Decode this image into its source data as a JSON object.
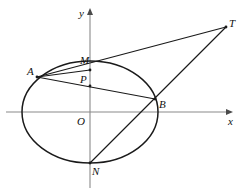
{
  "figure": {
    "kind": "geometry-diagram",
    "width": 245,
    "height": 195,
    "background_color": "#ffffff",
    "curve_color": "#1a1a1a",
    "axis_color": "#8a8a8a",
    "label_color": "#111111"
  },
  "axes": {
    "x_label": "x",
    "y_label": "y",
    "origin_label": "O",
    "x_axis": {
      "y_px": 112,
      "x_start_px": 6,
      "x_end_px": 233
    },
    "y_axis": {
      "x_px": 90,
      "y_start_px": 8,
      "y_end_px": 188
    },
    "arrows": [
      "x-positive",
      "y-positive"
    ]
  },
  "ellipse": {
    "center_px": {
      "x": 90,
      "y": 112
    },
    "semi_axis_x_px": 68,
    "semi_axis_y_px": 51,
    "stroke_width": 1.5
  },
  "points": {
    "A": {
      "label": "A",
      "x": 37,
      "y": 77,
      "label_x": 27,
      "label_y": 66
    },
    "B": {
      "label": "B",
      "x": 155,
      "y": 99,
      "label_x": 159,
      "label_y": 99
    },
    "M": {
      "label": "M",
      "x": 90,
      "y": 70,
      "label_x": 80,
      "label_y": 55
    },
    "N": {
      "label": "N",
      "x": 90,
      "y": 163,
      "label_x": 92,
      "label_y": 166
    },
    "O": {
      "label": "O",
      "x": 90,
      "y": 112,
      "label_x": 77,
      "label_y": 116
    },
    "P": {
      "label": "P",
      "x": 90,
      "y": 86,
      "label_x": 80,
      "label_y": 74
    },
    "T": {
      "label": "T",
      "x": 226,
      "y": 27,
      "label_x": 229,
      "label_y": 18
    }
  },
  "segments": [
    {
      "name": "segment-A-T",
      "from": "A",
      "to": "T",
      "passes_through": "M"
    },
    {
      "name": "segment-N-T",
      "from": "N",
      "to": "T",
      "passes_through": "B"
    },
    {
      "name": "segment-A-B",
      "from": "A",
      "to": "B",
      "passes_through": "P"
    },
    {
      "name": "segment-A-M",
      "from": "A",
      "to": "M"
    }
  ]
}
